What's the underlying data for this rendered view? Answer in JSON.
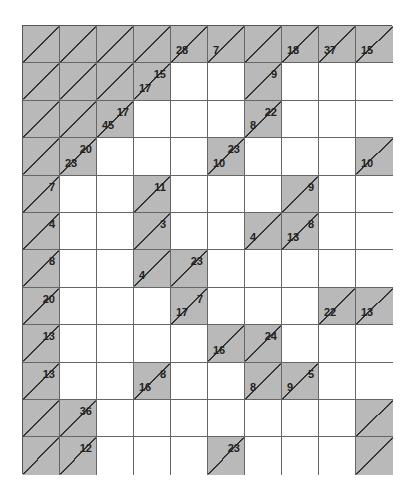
{
  "puzzle": {
    "type": "kakuro",
    "columns": 10,
    "rows": 12,
    "colors": {
      "clue_fill": "#b9b9b9",
      "white_fill": "#ffffff",
      "line": "#333333",
      "text": "#222222"
    },
    "grid": [
      [
        {
          "t": "B"
        },
        {
          "t": "B"
        },
        {
          "t": "B"
        },
        {
          "t": "B"
        },
        {
          "t": "B",
          "d": "28"
        },
        {
          "t": "B",
          "d": "7"
        },
        {
          "t": "B"
        },
        {
          "t": "B",
          "d": "18"
        },
        {
          "t": "B",
          "d": "37"
        },
        {
          "t": "B",
          "d": "15"
        }
      ],
      [
        {
          "t": "B"
        },
        {
          "t": "B"
        },
        {
          "t": "B"
        },
        {
          "t": "B",
          "d": "17",
          "r": "15"
        },
        {
          "t": "W"
        },
        {
          "t": "W"
        },
        {
          "t": "B",
          "r": "9"
        },
        {
          "t": "W"
        },
        {
          "t": "W"
        },
        {
          "t": "W"
        }
      ],
      [
        {
          "t": "B"
        },
        {
          "t": "B"
        },
        {
          "t": "B",
          "d": "45",
          "r": "17"
        },
        {
          "t": "W"
        },
        {
          "t": "W"
        },
        {
          "t": "W"
        },
        {
          "t": "B",
          "d": "8",
          "r": "22"
        },
        {
          "t": "W"
        },
        {
          "t": "W"
        },
        {
          "t": "W"
        }
      ],
      [
        {
          "t": "B"
        },
        {
          "t": "B",
          "d": "23",
          "r": "20"
        },
        {
          "t": "W"
        },
        {
          "t": "W"
        },
        {
          "t": "W"
        },
        {
          "t": "B",
          "d": "10",
          "r": "23"
        },
        {
          "t": "W"
        },
        {
          "t": "W"
        },
        {
          "t": "W"
        },
        {
          "t": "B",
          "d": "10"
        }
      ],
      [
        {
          "t": "B",
          "r": "7"
        },
        {
          "t": "W"
        },
        {
          "t": "W"
        },
        {
          "t": "B",
          "r": "11"
        },
        {
          "t": "W"
        },
        {
          "t": "W"
        },
        {
          "t": "W"
        },
        {
          "t": "B",
          "r": "9"
        },
        {
          "t": "W"
        },
        {
          "t": "W"
        }
      ],
      [
        {
          "t": "B",
          "r": "4"
        },
        {
          "t": "W"
        },
        {
          "t": "W"
        },
        {
          "t": "B",
          "r": "3"
        },
        {
          "t": "W"
        },
        {
          "t": "W"
        },
        {
          "t": "B",
          "d": "4"
        },
        {
          "t": "B",
          "d": "13",
          "r": "8"
        },
        {
          "t": "W"
        },
        {
          "t": "W"
        }
      ],
      [
        {
          "t": "B",
          "r": "8"
        },
        {
          "t": "W"
        },
        {
          "t": "W"
        },
        {
          "t": "B",
          "d": "4"
        },
        {
          "t": "B",
          "r": "23"
        },
        {
          "t": "W"
        },
        {
          "t": "W"
        },
        {
          "t": "W"
        },
        {
          "t": "W"
        },
        {
          "t": "W"
        }
      ],
      [
        {
          "t": "B",
          "r": "20"
        },
        {
          "t": "W"
        },
        {
          "t": "W"
        },
        {
          "t": "W"
        },
        {
          "t": "B",
          "d": "17",
          "r": "7"
        },
        {
          "t": "W"
        },
        {
          "t": "W"
        },
        {
          "t": "W"
        },
        {
          "t": "B",
          "d": "22"
        },
        {
          "t": "B",
          "d": "13"
        }
      ],
      [
        {
          "t": "B",
          "r": "13"
        },
        {
          "t": "W"
        },
        {
          "t": "W"
        },
        {
          "t": "W"
        },
        {
          "t": "W"
        },
        {
          "t": "B",
          "d": "16"
        },
        {
          "t": "B",
          "r": "24"
        },
        {
          "t": "W"
        },
        {
          "t": "W"
        },
        {
          "t": "W"
        }
      ],
      [
        {
          "t": "B",
          "r": "13"
        },
        {
          "t": "W"
        },
        {
          "t": "W"
        },
        {
          "t": "B",
          "d": "16",
          "r": "8"
        },
        {
          "t": "W"
        },
        {
          "t": "W"
        },
        {
          "t": "B",
          "d": "8"
        },
        {
          "t": "B",
          "d": "9",
          "r": "5"
        },
        {
          "t": "W"
        },
        {
          "t": "W"
        }
      ],
      [
        {
          "t": "B"
        },
        {
          "t": "B",
          "r": "36"
        },
        {
          "t": "W"
        },
        {
          "t": "W"
        },
        {
          "t": "W"
        },
        {
          "t": "W"
        },
        {
          "t": "W"
        },
        {
          "t": "W"
        },
        {
          "t": "W"
        },
        {
          "t": "B"
        }
      ],
      [
        {
          "t": "B"
        },
        {
          "t": "B",
          "r": "12"
        },
        {
          "t": "W"
        },
        {
          "t": "W"
        },
        {
          "t": "W"
        },
        {
          "t": "B",
          "r": "23"
        },
        {
          "t": "W"
        },
        {
          "t": "W"
        },
        {
          "t": "W"
        },
        {
          "t": "B"
        }
      ]
    ]
  }
}
